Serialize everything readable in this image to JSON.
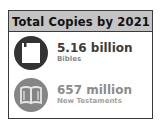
{
  "header": {
    "title": "Total Copies by 2021"
  },
  "stats": [
    {
      "icon": "closed-book-icon",
      "value": "5.16 billion",
      "label": "Bibles",
      "circle_color": "#333333",
      "value_color": "#3c3c3c",
      "label_color": "#8a8a8a"
    },
    {
      "icon": "open-book-icon",
      "value": "657 million",
      "label": "New Testaments",
      "circle_color": "#858585",
      "value_color": "#8c8c8c",
      "label_color": "#a3a3a3"
    }
  ]
}
